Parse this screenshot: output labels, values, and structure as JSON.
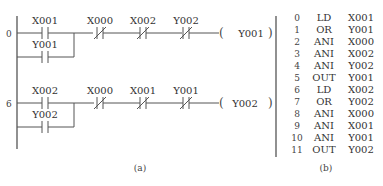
{
  "ladder": {
    "caption": "(a)",
    "rungs": [
      {
        "step": "0",
        "main_contact": "X001",
        "branch_contact": "Y001",
        "nc_contacts": [
          "X000",
          "X002",
          "Y002"
        ],
        "coil": "Y001"
      },
      {
        "step": "6",
        "main_contact": "X002",
        "branch_contact": "Y002",
        "nc_contacts": [
          "X000",
          "X001",
          "Y001"
        ],
        "coil": "Y002"
      }
    ]
  },
  "instruction_list": {
    "caption": "(b)",
    "rows": [
      {
        "step": "0",
        "op": "LD",
        "operand": "X001"
      },
      {
        "step": "1",
        "op": "OR",
        "operand": "Y001"
      },
      {
        "step": "2",
        "op": "ANI",
        "operand": "X000"
      },
      {
        "step": "3",
        "op": "ANI",
        "operand": "X002"
      },
      {
        "step": "4",
        "op": "ANI",
        "operand": "Y002"
      },
      {
        "step": "5",
        "op": "OUT",
        "operand": "Y001"
      },
      {
        "step": "6",
        "op": "LD",
        "operand": "X002"
      },
      {
        "step": "7",
        "op": "OR",
        "operand": "Y002"
      },
      {
        "step": "8",
        "op": "ANI",
        "operand": "X000"
      },
      {
        "step": "9",
        "op": "ANI",
        "operand": "X001"
      },
      {
        "step": "10",
        "op": "ANI",
        "operand": "Y001"
      },
      {
        "step": "11",
        "op": "OUT",
        "operand": "Y002"
      }
    ]
  }
}
